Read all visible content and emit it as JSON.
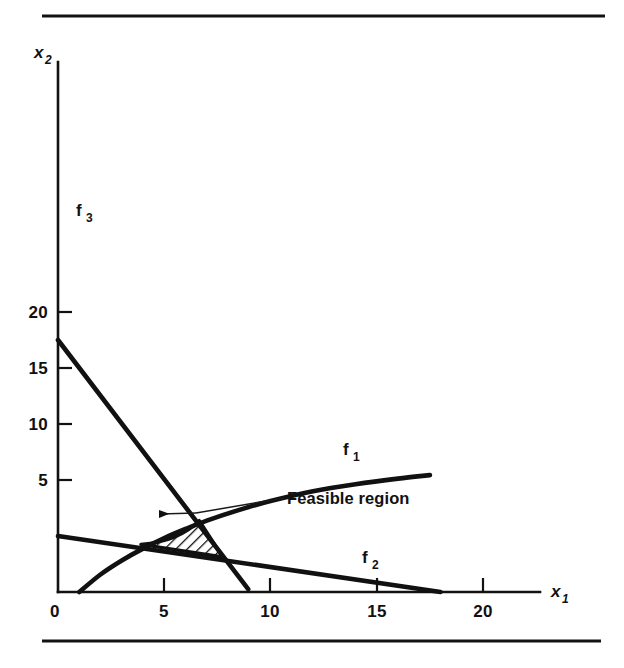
{
  "figure": {
    "background_color": "#ffffff",
    "ink_color": "#111111",
    "top_rule": {
      "x1": 42,
      "x2": 605,
      "y": 16,
      "thickness": 3.2
    },
    "bottom_rule": {
      "x1": 42,
      "x2": 601,
      "y": 641,
      "thickness": 3.2
    }
  },
  "chart_data": {
    "type": "line",
    "title": "",
    "subtitle": "",
    "xlabel": "x_1",
    "ylabel": "x_2",
    "xlim": [
      0,
      23.5
    ],
    "ylim": [
      0,
      23.5
    ],
    "grid": false,
    "legend_position": "inline-curve-labels",
    "xticks": [
      0,
      5,
      10,
      15,
      20
    ],
    "xtick_labels": [
      "0",
      "5",
      "10",
      "15",
      "20"
    ],
    "yticks": [
      5,
      10,
      15,
      20
    ],
    "ytick_labels": [
      "5",
      "10",
      "15",
      "20"
    ],
    "origin_label": "0",
    "series": [
      {
        "name": "f_1",
        "label": "f",
        "label_sub": "1",
        "shape": "concave-increasing-curve",
        "description": "Constraint boundary f1, rises steeply from the x-axis then flattens",
        "points": [
          [
            1.0,
            0.0
          ],
          [
            2.0,
            1.25
          ],
          [
            3.0,
            2.25
          ],
          [
            4.0,
            3.1
          ],
          [
            5.0,
            3.85
          ],
          [
            6.0,
            4.5
          ],
          [
            7.0,
            5.1
          ],
          [
            8.5,
            5.85
          ],
          [
            10.0,
            6.5
          ],
          [
            12.0,
            7.2
          ],
          [
            14.0,
            7.7
          ],
          [
            16.0,
            8.1
          ],
          [
            17.5,
            8.35
          ]
        ],
        "label_point": [
          13.7,
          4.6
        ]
      },
      {
        "name": "f_2",
        "label": "f",
        "label_sub": "2",
        "shape": "straight-line",
        "description": "Constraint boundary f2, descending line",
        "points": [
          [
            0.0,
            4.0
          ],
          [
            18.0,
            0.0
          ]
        ],
        "label_point": [
          14.6,
          1.5
        ]
      },
      {
        "name": "f_3",
        "label": "f",
        "label_sub": "3",
        "shape": "straight-line",
        "description": "Constraint boundary f3, steeply descending line",
        "points": [
          [
            0.0,
            18.0
          ],
          [
            8.95,
            0.2
          ]
        ],
        "label_point": [
          1.2,
          16.1
        ]
      }
    ],
    "shaded_regions": [
      {
        "name": "feasible-region",
        "label": "Feasible region",
        "fill": "diagonal-hatch",
        "hatch_angle_deg": 45,
        "vertices": [
          [
            3.9,
            3.4
          ],
          [
            6.65,
            5.1
          ],
          [
            7.75,
            2.5
          ]
        ],
        "description": "Curvilinear triangle bounded above-left by f1, right by f3, below by f2"
      }
    ],
    "annotations": [
      {
        "name": "feasible-region-annotation",
        "text": "Feasible region",
        "text_anchor_px": [
          287,
          504
        ],
        "leader_from_px": [
          284,
          498
        ],
        "leader_to_px": [
          196,
          513
        ],
        "arrow_tip_px": [
          160,
          514
        ],
        "arrow_tail_px": [
          196,
          513
        ]
      }
    ]
  }
}
